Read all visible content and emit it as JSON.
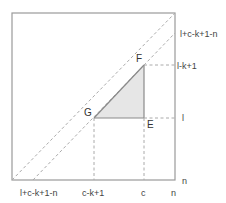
{
  "diagram": {
    "type": "geometric-region",
    "colors": {
      "border": "#9a9a9a",
      "dashed": "#aaaaaa",
      "solid_edge": "#8a8a8a",
      "shade": "#e6e6e6",
      "text": "#444444"
    },
    "points": {
      "F": "F",
      "G": "G",
      "E": "E"
    },
    "right_labels": {
      "top_diag": "l+c-k+1-n",
      "lk1": "l-k+1",
      "l": "l",
      "n": "n"
    },
    "bottom_labels": {
      "diag": "l+c-k+1-n",
      "ck1": "c-k+1",
      "c": "c",
      "n": "n"
    }
  }
}
